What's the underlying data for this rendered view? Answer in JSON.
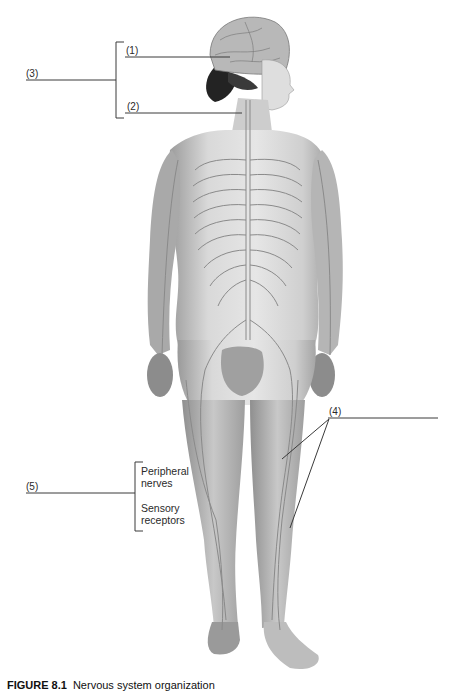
{
  "figure": {
    "labels": {
      "l1": "(1)",
      "l2": "(2)",
      "l3": "(3)",
      "l4": "(4)",
      "l5": "(5)"
    },
    "group5": {
      "item1_line1": "Peripheral",
      "item1_line2": "nerves",
      "item2_line1": "Sensory",
      "item2_line2": "receptors"
    },
    "caption": {
      "number": "FIGURE 8.1",
      "text": "Nervous system organization"
    },
    "colors": {
      "line": "#3a3a3a",
      "skin": "#d4d4d4",
      "nerve": "#9a9a9a",
      "hair": "#262626"
    }
  }
}
